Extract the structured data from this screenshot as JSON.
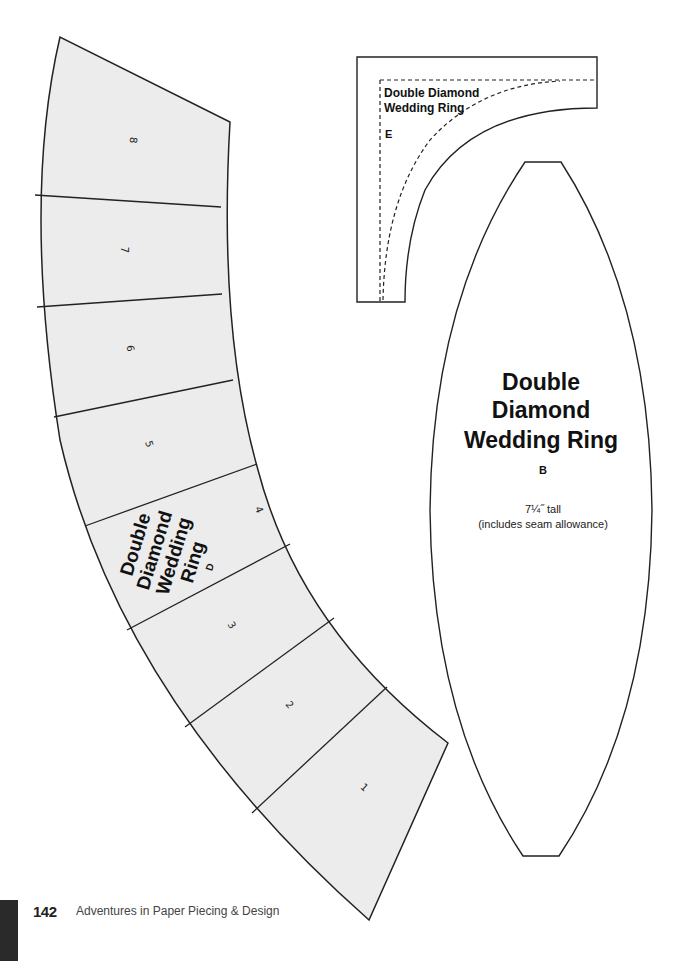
{
  "pattern_d": {
    "title_lines": [
      "Double",
      "Diamond",
      "Wedding",
      "Ring"
    ],
    "letter": "D",
    "segment_numbers": [
      "8",
      "7",
      "6",
      "5",
      "4",
      "3",
      "2",
      "1"
    ],
    "fill": "#ececec"
  },
  "pattern_e": {
    "title_lines": [
      "Double Diamond",
      "Wedding Ring"
    ],
    "letter": "E"
  },
  "pattern_b": {
    "title_lines": [
      "Double",
      "Diamond",
      "Wedding Ring"
    ],
    "letter": "B",
    "size_note": "7¼˝ tall",
    "seam_note": "(includes seam allowance)"
  },
  "footer": {
    "page_number": "142",
    "book_title": "Adventures in Paper Piecing & Design"
  }
}
